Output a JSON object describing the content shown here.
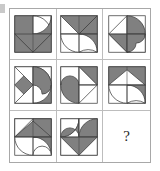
{
  "puzzle": {
    "type": "matrix-reasoning",
    "rows": 3,
    "columns": 3,
    "missing_cell": "row3-col3",
    "missing_marker": "?",
    "colors": {
      "fill": "#808080",
      "stroke": "#404040",
      "background": "#ffffff",
      "grid_line": "#bdbdbd",
      "frame": "#a8a8a8",
      "question_mark": "#262626"
    },
    "cells": [
      {
        "id": "cell-r1c1",
        "row": 1,
        "column": 1,
        "description": "Two filled quarter-round hook shapes forming a pinwheel in the upper area with a filled downward triangle at the bottom",
        "elements": [
          "hook-shape-filled",
          "hook-shape-outline",
          "triangle-down-filled"
        ]
      },
      {
        "id": "cell-r1c2",
        "row": 1,
        "column": 2,
        "description": "Filled triangles forming an arrow in the top half and an S-curve ribbon in the bottom half",
        "elements": [
          "triangle-left-filled",
          "triangle-right-filled",
          "s-curve-outline"
        ]
      },
      {
        "id": "cell-r1c3",
        "row": 1,
        "column": 3,
        "description": "Outlined triangle pointing left on the left side and a filled half-disc with a curved notch on the right",
        "elements": [
          "triangle-left-outline",
          "half-disc-filled",
          "curve-notch"
        ]
      },
      {
        "id": "cell-r2c1",
        "row": 2,
        "column": 1,
        "description": "Filled triangle pointing left on the left side and curved hook shapes on the right",
        "elements": [
          "triangle-left-filled",
          "hook-shape-filled",
          "quarter-circle-outline"
        ]
      },
      {
        "id": "cell-r2c2",
        "row": 2,
        "column": 2,
        "description": "Filled curved hook occupying the left half and outlined triangles pointing right on the right half",
        "elements": [
          "hook-shape-filled",
          "triangle-right-outline",
          "triangle-up-filled"
        ]
      },
      {
        "id": "cell-r2c3",
        "row": 2,
        "column": 3,
        "description": "Filled triangles forming an upward arrow in the top half and an S-curve ribbon in the bottom half",
        "elements": [
          "triangle-up-filled",
          "triangle-left-filled",
          "s-curve-outline"
        ]
      },
      {
        "id": "cell-r3c1",
        "row": 3,
        "column": 1,
        "description": "Filled triangles forming an arrow in the top half and a curved hook sweeping to the lower left",
        "elements": [
          "triangle-up-filled",
          "triangle-left-outline",
          "hook-shape-outline"
        ]
      },
      {
        "id": "cell-r3c2",
        "row": 3,
        "column": 2,
        "description": "S-curve ribbon in the top half and a filled downward triangle in the bottom half",
        "elements": [
          "s-curve-outline",
          "triangle-down-filled"
        ]
      },
      {
        "id": "cell-r3c3",
        "row": 3,
        "column": 3,
        "description": "Empty answer cell containing a question mark",
        "elements": [
          "question-mark"
        ]
      }
    ]
  }
}
